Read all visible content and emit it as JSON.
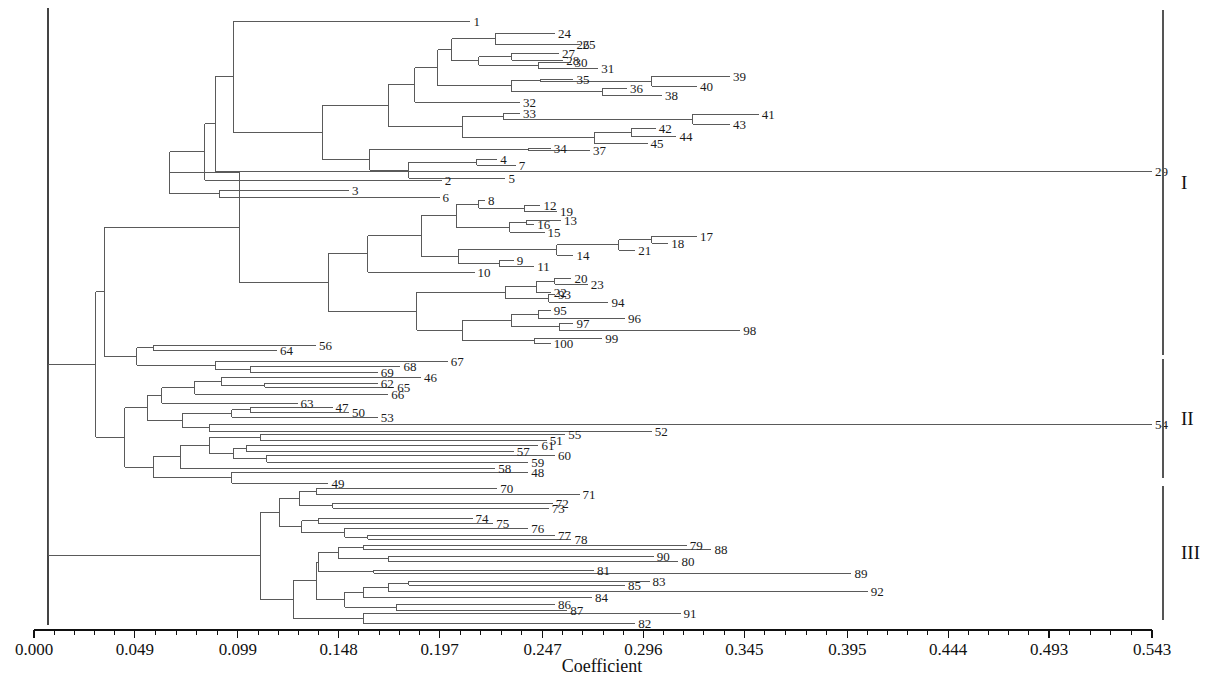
{
  "chart_data": {
    "type": "tree",
    "title": "",
    "xlabel": "Coefficient",
    "ylabel": "",
    "xlim": [
      0.0,
      0.543
    ],
    "grid": false,
    "legend": "none",
    "axis": {
      "ticks": [
        "0.000",
        "0.049",
        "0.099",
        "0.148",
        "0.197",
        "0.247",
        "0.296",
        "0.345",
        "0.395",
        "0.444",
        "0.493",
        "0.543"
      ],
      "tick_values": [
        0.0,
        0.049,
        0.099,
        0.148,
        0.197,
        0.247,
        0.296,
        0.345,
        0.395,
        0.444,
        0.493,
        0.543
      ],
      "minor_per_interval": 4,
      "pixel_start": 34,
      "pixel_end": 1152
    },
    "clusters": [
      {
        "label": "I",
        "y_top": 10,
        "y_bottom": 355
      },
      {
        "label": "II",
        "y_top": 359,
        "y_bottom": 478
      },
      {
        "label": "III",
        "y_top": 486,
        "y_bottom": 620
      }
    ],
    "leaves": [
      {
        "label": "1",
        "y": 21,
        "x": 0.212
      },
      {
        "label": "24",
        "y": 33,
        "x": 0.253
      },
      {
        "label": "25",
        "y": 44,
        "x": 0.265
      },
      {
        "label": "26",
        "y": 44,
        "x": 0.262
      },
      {
        "label": "27",
        "y": 53,
        "x": 0.255
      },
      {
        "label": "28",
        "y": 60,
        "x": 0.257
      },
      {
        "label": "30",
        "y": 62,
        "x": 0.261
      },
      {
        "label": "31",
        "y": 68,
        "x": 0.274
      },
      {
        "label": "35",
        "y": 79,
        "x": 0.262
      },
      {
        "label": "39",
        "y": 76,
        "x": 0.338
      },
      {
        "label": "40",
        "y": 86,
        "x": 0.322
      },
      {
        "label": "36",
        "y": 88,
        "x": 0.288
      },
      {
        "label": "38",
        "y": 95,
        "x": 0.305
      },
      {
        "label": "32",
        "y": 102,
        "x": 0.236
      },
      {
        "label": "33",
        "y": 113,
        "x": 0.236
      },
      {
        "label": "41",
        "y": 114,
        "x": 0.352
      },
      {
        "label": "43",
        "y": 124,
        "x": 0.338
      },
      {
        "label": "42",
        "y": 128,
        "x": 0.302
      },
      {
        "label": "44",
        "y": 136,
        "x": 0.312
      },
      {
        "label": "45",
        "y": 143,
        "x": 0.298
      },
      {
        "label": "34",
        "y": 148,
        "x": 0.251
      },
      {
        "label": "37",
        "y": 150,
        "x": 0.27
      },
      {
        "label": "4",
        "y": 159,
        "x": 0.225
      },
      {
        "label": "7",
        "y": 165,
        "x": 0.234
      },
      {
        "label": "5",
        "y": 178,
        "x": 0.229
      },
      {
        "label": "29",
        "y": 171,
        "x": 0.543
      },
      {
        "label": "2",
        "y": 180,
        "x": 0.198
      },
      {
        "label": "3",
        "y": 190,
        "x": 0.153
      },
      {
        "label": "6",
        "y": 197,
        "x": 0.197
      },
      {
        "label": "8",
        "y": 200,
        "x": 0.219
      },
      {
        "label": "12",
        "y": 205,
        "x": 0.246
      },
      {
        "label": "19",
        "y": 211,
        "x": 0.254
      },
      {
        "label": "16",
        "y": 224,
        "x": 0.243
      },
      {
        "label": "13",
        "y": 220,
        "x": 0.256
      },
      {
        "label": "15",
        "y": 232,
        "x": 0.248
      },
      {
        "label": "17",
        "y": 236,
        "x": 0.322
      },
      {
        "label": "18",
        "y": 243,
        "x": 0.308
      },
      {
        "label": "21",
        "y": 250,
        "x": 0.292
      },
      {
        "label": "14",
        "y": 255,
        "x": 0.262
      },
      {
        "label": "9",
        "y": 260,
        "x": 0.233
      },
      {
        "label": "11",
        "y": 266,
        "x": 0.243
      },
      {
        "label": "10",
        "y": 272,
        "x": 0.214
      },
      {
        "label": "20",
        "y": 278,
        "x": 0.261
      },
      {
        "label": "23",
        "y": 284,
        "x": 0.269
      },
      {
        "label": "22",
        "y": 292,
        "x": 0.251
      },
      {
        "label": "93",
        "y": 294,
        "x": 0.253
      },
      {
        "label": "94",
        "y": 302,
        "x": 0.279
      },
      {
        "label": "95",
        "y": 310,
        "x": 0.251
      },
      {
        "label": "96",
        "y": 318,
        "x": 0.287
      },
      {
        "label": "97",
        "y": 323,
        "x": 0.262
      },
      {
        "label": "98",
        "y": 330,
        "x": 0.343
      },
      {
        "label": "99",
        "y": 338,
        "x": 0.276
      },
      {
        "label": "100",
        "y": 343,
        "x": 0.251
      },
      {
        "label": "64",
        "y": 350,
        "x": 0.118
      },
      {
        "label": "56",
        "y": 345,
        "x": 0.137
      },
      {
        "label": "67",
        "y": 361,
        "x": 0.201
      },
      {
        "label": "69",
        "y": 372,
        "x": 0.167
      },
      {
        "label": "68",
        "y": 366,
        "x": 0.178
      },
      {
        "label": "46",
        "y": 377,
        "x": 0.188
      },
      {
        "label": "62",
        "y": 383,
        "x": 0.167
      },
      {
        "label": "65",
        "y": 387,
        "x": 0.175
      },
      {
        "label": "66",
        "y": 394,
        "x": 0.172
      },
      {
        "label": "63",
        "y": 403,
        "x": 0.128
      },
      {
        "label": "47",
        "y": 407,
        "x": 0.145
      },
      {
        "label": "50",
        "y": 412,
        "x": 0.153
      },
      {
        "label": "53",
        "y": 417,
        "x": 0.167
      },
      {
        "label": "52",
        "y": 431,
        "x": 0.3
      },
      {
        "label": "54",
        "y": 424,
        "x": 0.543
      },
      {
        "label": "55",
        "y": 434,
        "x": 0.258
      },
      {
        "label": "51",
        "y": 440,
        "x": 0.249
      },
      {
        "label": "61",
        "y": 445,
        "x": 0.245
      },
      {
        "label": "57",
        "y": 451,
        "x": 0.233
      },
      {
        "label": "60",
        "y": 455,
        "x": 0.253
      },
      {
        "label": "59",
        "y": 462,
        "x": 0.24
      },
      {
        "label": "58",
        "y": 468,
        "x": 0.224
      },
      {
        "label": "48",
        "y": 472,
        "x": 0.24
      },
      {
        "label": "49",
        "y": 483,
        "x": 0.143
      },
      {
        "label": "70",
        "y": 488,
        "x": 0.225
      },
      {
        "label": "71",
        "y": 494,
        "x": 0.265
      },
      {
        "label": "72",
        "y": 503,
        "x": 0.252
      },
      {
        "label": "73",
        "y": 508,
        "x": 0.25
      },
      {
        "label": "74",
        "y": 518,
        "x": 0.213
      },
      {
        "label": "75",
        "y": 523,
        "x": 0.223
      },
      {
        "label": "76",
        "y": 528,
        "x": 0.24
      },
      {
        "label": "77",
        "y": 535,
        "x": 0.253
      },
      {
        "label": "78",
        "y": 539,
        "x": 0.261
      },
      {
        "label": "79",
        "y": 545,
        "x": 0.317
      },
      {
        "label": "88",
        "y": 549,
        "x": 0.329
      },
      {
        "label": "90",
        "y": 556,
        "x": 0.301
      },
      {
        "label": "80",
        "y": 561,
        "x": 0.313
      },
      {
        "label": "81",
        "y": 570,
        "x": 0.272
      },
      {
        "label": "89",
        "y": 573,
        "x": 0.397
      },
      {
        "label": "85",
        "y": 585,
        "x": 0.287
      },
      {
        "label": "83",
        "y": 581,
        "x": 0.299
      },
      {
        "label": "92",
        "y": 591,
        "x": 0.405
      },
      {
        "label": "84",
        "y": 597,
        "x": 0.271
      },
      {
        "label": "86",
        "y": 604,
        "x": 0.253
      },
      {
        "label": "87",
        "y": 610,
        "x": 0.259
      },
      {
        "label": "91",
        "y": 613,
        "x": 0.314
      },
      {
        "label": "82",
        "y": 623,
        "x": 0.292
      }
    ]
  },
  "axis_title": "Coefficient",
  "cluster_labels": {
    "one": "I",
    "two": "II",
    "three": "III"
  }
}
